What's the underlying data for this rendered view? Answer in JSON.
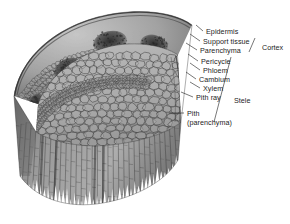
{
  "figure": {
    "background_color": "#ffffff",
    "ink_color": "#1d1d1d",
    "tissue_light": "#b9b9b9",
    "tissue_mid": "#8e8e8e",
    "tissue_dark": "#4a4a4a",
    "bundle_color": "#3a3a3a"
  },
  "labels": [
    {
      "id": "epidermis",
      "text": "Epidermis",
      "x": 206,
      "y": 28,
      "tick_x1": 203,
      "tick_y1": 31,
      "tick_x2": 196,
      "tick_y2": 25
    },
    {
      "id": "support-tissue",
      "text": "Support tissue",
      "x": 203,
      "y": 38,
      "tick_x1": 200,
      "tick_y1": 41,
      "tick_x2": 190,
      "tick_y2": 34
    },
    {
      "id": "parenchyma",
      "text": "Parenchyma",
      "x": 200,
      "y": 47,
      "tick_x1": 197,
      "tick_y1": 50,
      "tick_x2": 186,
      "tick_y2": 43
    },
    {
      "id": "pericycle",
      "text": "Pericycle",
      "x": 201,
      "y": 58,
      "tick_x1": 198,
      "tick_y1": 61,
      "tick_x2": 188,
      "tick_y2": 54
    },
    {
      "id": "phloem",
      "text": "Phloem",
      "x": 203,
      "y": 67,
      "tick_x1": 200,
      "tick_y1": 70,
      "tick_x2": 190,
      "tick_y2": 63
    },
    {
      "id": "cambium",
      "text": "Cambium",
      "x": 199,
      "y": 76,
      "tick_x1": 196,
      "tick_y1": 79,
      "tick_x2": 186,
      "tick_y2": 72
    },
    {
      "id": "xylem",
      "text": "Xylem",
      "x": 203,
      "y": 85,
      "tick_x1": 200,
      "tick_y1": 88,
      "tick_x2": 190,
      "tick_y2": 82
    },
    {
      "id": "pith-ray",
      "text": "Pith ray",
      "x": 196,
      "y": 94,
      "tick_x1": 193,
      "tick_y1": 97,
      "tick_x2": 181,
      "tick_y2": 92
    },
    {
      "id": "pith",
      "text": "Pith",
      "x": 187,
      "y": 110,
      "tick_x1": 184,
      "tick_y1": 113,
      "tick_x2": 169,
      "tick_y2": 113
    },
    {
      "id": "pith-paren",
      "text": "(parenchyma)",
      "x": 187,
      "y": 119,
      "tick_x1": null,
      "tick_y1": null,
      "tick_x2": null,
      "tick_y2": null
    }
  ],
  "groups": [
    {
      "id": "cortex",
      "text": "Cortex",
      "x": 262,
      "y": 44,
      "bracket": {
        "x1": 255,
        "y1": 38,
        "x2": 249,
        "y2": 52
      }
    },
    {
      "id": "stele",
      "text": "Stele",
      "x": 234,
      "y": 97,
      "bracket": {
        "x1": 231,
        "y1": 57,
        "x2": 214,
        "y2": 122
      }
    }
  ]
}
